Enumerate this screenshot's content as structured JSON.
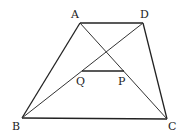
{
  "diagram": {
    "points": {
      "A": {
        "x": 80,
        "y": 23
      },
      "D": {
        "x": 143,
        "y": 23
      },
      "B": {
        "x": 22,
        "y": 118
      },
      "C": {
        "x": 167,
        "y": 119
      },
      "Q": {
        "x": 82,
        "y": 71
      },
      "P": {
        "x": 124,
        "y": 71
      }
    },
    "labels": {
      "A": "A",
      "D": "D",
      "B": "B",
      "C": "C",
      "Q": "Q",
      "P": "P"
    },
    "segments": [
      "AD",
      "AB",
      "DC",
      "BC",
      "AC",
      "BD",
      "QP"
    ],
    "colors": {
      "stroke": "#222222",
      "background": "#ffffff"
    }
  }
}
